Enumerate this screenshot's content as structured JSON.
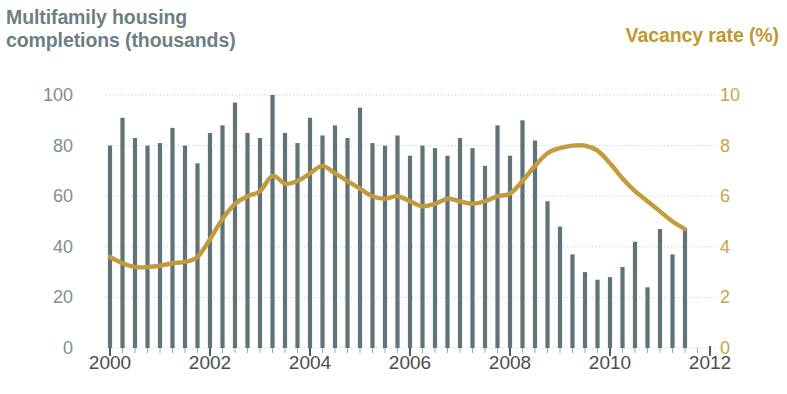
{
  "titles": {
    "left": "Multifamily housing completions (thousands)",
    "left_line1": "Multifamily housing",
    "left_line2": "completions (thousands)",
    "right": "Vacancy rate (%)"
  },
  "colors": {
    "bars": "#5f7378",
    "line": "#c49a3f",
    "left_title": "#6c8084",
    "right_title": "#bf9830",
    "left_axis_text": "#7d8f93",
    "right_axis_text": "#c9a349",
    "xaxis_text": "#4c4c4c",
    "gridline": "#b9c4c6",
    "background": "#ffffff"
  },
  "chart_data": {
    "type": "bar",
    "xlabel": "",
    "ylabel": "Multifamily housing completions (thousands)",
    "y2label": "Vacancy rate (%)",
    "xlim": [
      2000.0,
      2012.0
    ],
    "ylim": [
      0,
      100
    ],
    "y2lim": [
      0,
      10
    ],
    "yticks": [
      0,
      20,
      40,
      60,
      80,
      100
    ],
    "y2ticks": [
      0,
      2,
      4,
      6,
      8,
      10
    ],
    "xticks": [
      2000,
      2002,
      2004,
      2006,
      2008,
      2010,
      2012
    ],
    "xtick_labels": [
      "2000",
      "2002",
      "2004",
      "2006",
      "2008",
      "2010",
      "2012"
    ],
    "minor_xtick_interval": 0.25,
    "grid": "horizontal-dotted",
    "legend": "none",
    "series": [
      {
        "name": "Multifamily housing completions (thousands)",
        "type": "bar",
        "axis": "left",
        "color": "#5f7378",
        "x": [
          2000.0,
          2000.25,
          2000.5,
          2000.75,
          2001.0,
          2001.25,
          2001.5,
          2001.75,
          2002.0,
          2002.25,
          2002.5,
          2002.75,
          2003.0,
          2003.25,
          2003.5,
          2003.75,
          2004.0,
          2004.25,
          2004.5,
          2004.75,
          2005.0,
          2005.25,
          2005.5,
          2005.75,
          2006.0,
          2006.25,
          2006.5,
          2006.75,
          2007.0,
          2007.25,
          2007.5,
          2007.75,
          2008.0,
          2008.25,
          2008.5,
          2008.75,
          2009.0,
          2009.25,
          2009.5,
          2009.75,
          2010.0,
          2010.25,
          2010.5,
          2010.75,
          2011.0,
          2011.25,
          2011.5
        ],
        "values": [
          80,
          91,
          83,
          80,
          81,
          87,
          80,
          73,
          85,
          88,
          97,
          85,
          83,
          100,
          85,
          81,
          91,
          84,
          88,
          83,
          95,
          81,
          80,
          84,
          76,
          80,
          79,
          76,
          83,
          79,
          72,
          88,
          76,
          90,
          82,
          58,
          48,
          37,
          30,
          27,
          28,
          32,
          42,
          24,
          47,
          37,
          47
        ]
      },
      {
        "name": "Vacancy rate (%)",
        "type": "line",
        "axis": "right",
        "color": "#c49a3f",
        "x": [
          2000.0,
          2000.25,
          2000.5,
          2000.75,
          2001.0,
          2001.25,
          2001.5,
          2001.75,
          2002.0,
          2002.25,
          2002.5,
          2002.75,
          2003.0,
          2003.25,
          2003.5,
          2003.75,
          2004.0,
          2004.25,
          2004.5,
          2004.75,
          2005.0,
          2005.25,
          2005.5,
          2005.75,
          2006.0,
          2006.25,
          2006.5,
          2006.75,
          2007.0,
          2007.25,
          2007.5,
          2007.75,
          2008.0,
          2008.25,
          2008.5,
          2008.75,
          2009.0,
          2009.25,
          2009.5,
          2009.75,
          2010.0,
          2010.25,
          2010.5,
          2010.75,
          2011.0,
          2011.25,
          2011.5
        ],
        "values": [
          3.6,
          3.35,
          3.2,
          3.2,
          3.25,
          3.35,
          3.4,
          3.6,
          4.3,
          5.1,
          5.7,
          6.0,
          6.2,
          6.8,
          6.5,
          6.6,
          6.9,
          7.2,
          6.9,
          6.6,
          6.3,
          6.0,
          5.9,
          6.0,
          5.8,
          5.6,
          5.7,
          5.9,
          5.8,
          5.7,
          5.8,
          6.0,
          6.1,
          6.6,
          7.2,
          7.7,
          7.9,
          8.0,
          8.0,
          7.8,
          7.3,
          6.7,
          6.2,
          5.8,
          5.4,
          5.0,
          4.7
        ]
      }
    ]
  }
}
